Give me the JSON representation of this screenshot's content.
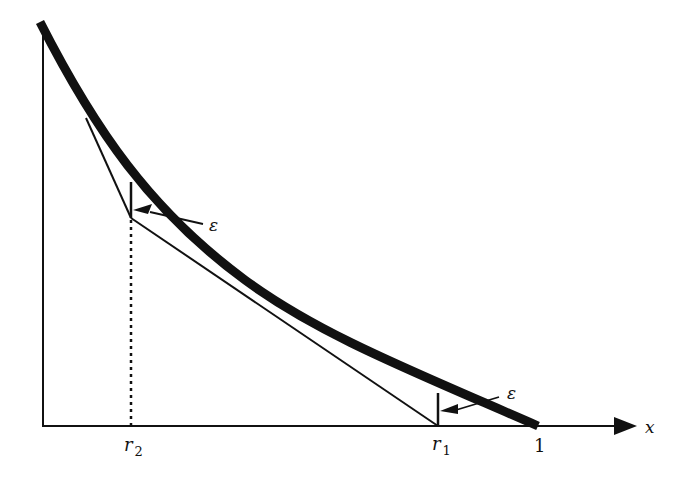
{
  "diagram": {
    "colors": {
      "ink": "#111111",
      "background": "#ffffff"
    },
    "axes": {
      "x_label": "x",
      "origin": [
        43,
        426
      ],
      "x_axis_end": [
        636,
        426
      ],
      "y_axis_top": [
        43,
        25
      ]
    },
    "labels": {
      "r2_main": "r",
      "r2_sub": "2",
      "r1_main": "r",
      "r1_sub": "1",
      "one": "1",
      "x": "x",
      "epsilon_upper": "ε",
      "epsilon_lower": "ε"
    },
    "points": {
      "curve_start": [
        40,
        22
      ],
      "curve_end": [
        538,
        426
      ],
      "r2_x": 131,
      "r1_x": 438,
      "one_x": 538
    },
    "annotations": [
      {
        "name": "epsilon-upper",
        "text": "ε",
        "position": [
          212,
          228
        ]
      },
      {
        "name": "epsilon-lower",
        "text": "ε",
        "position": [
          510,
          397
        ]
      }
    ]
  }
}
